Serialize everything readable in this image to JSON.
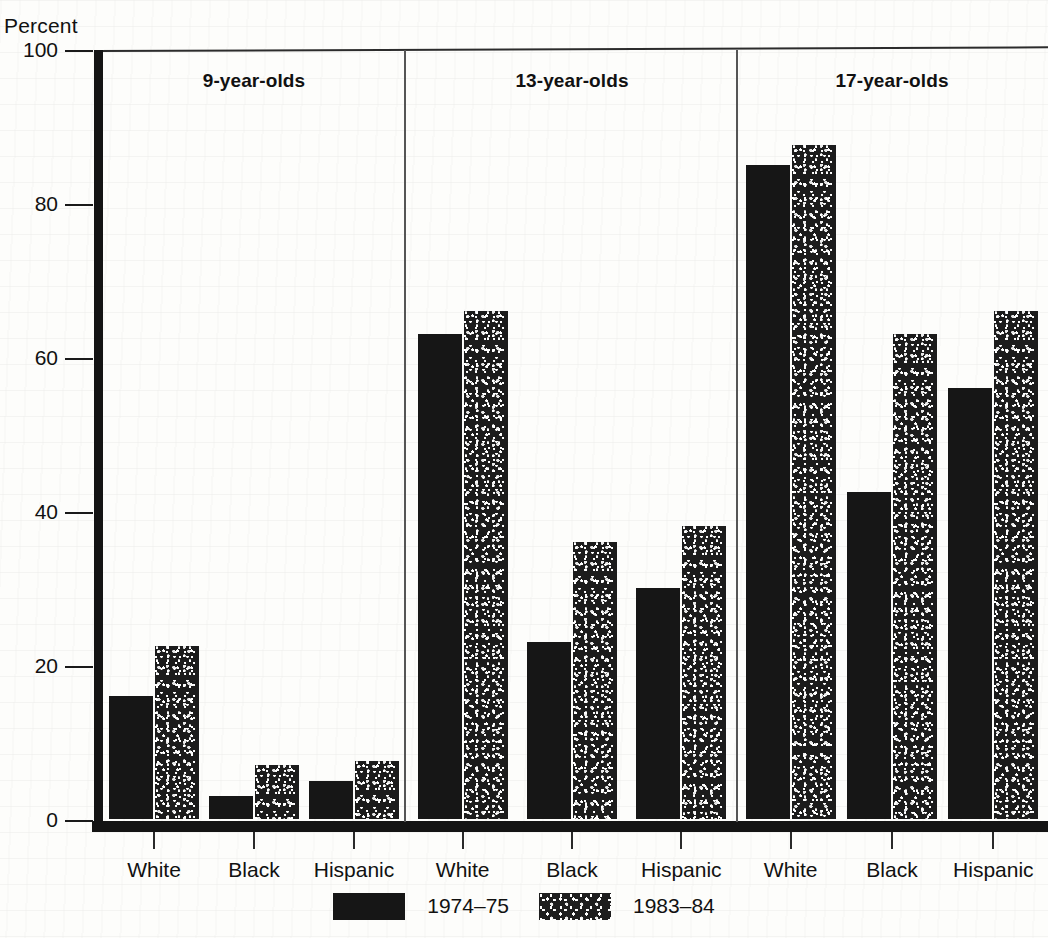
{
  "axis": {
    "y_title": "Percent",
    "y_ticks": [
      "100",
      "80",
      "60",
      "40",
      "20",
      "0"
    ]
  },
  "groups": [
    {
      "heading": "9-year-olds",
      "categories": [
        "White",
        "Black",
        "Hispanic"
      ]
    },
    {
      "heading": "13-year-olds",
      "categories": [
        "White",
        "Black",
        "Hispanic"
      ]
    },
    {
      "heading": "17-year-olds",
      "categories": [
        "White",
        "Black",
        "Hispanic"
      ]
    }
  ],
  "legend": {
    "items": [
      {
        "label": "1974–75",
        "swatch": "solid-black-swatch"
      },
      {
        "label": "1983–84",
        "swatch": "speckled-swatch"
      }
    ]
  },
  "colors": {
    "series_1974_75": "#161616",
    "series_1983_84": "#1e1e1e",
    "axis": "#141414",
    "background": "#fdfdfb"
  },
  "chart_data": {
    "type": "bar",
    "title": "",
    "subtitle": "",
    "xlabel": "",
    "ylabel": "Percent",
    "ylim": [
      0,
      100
    ],
    "yticks": [
      0,
      20,
      40,
      60,
      80,
      100
    ],
    "grid": false,
    "legend_position": "bottom-center",
    "group_labels": [
      "9-year-olds",
      "13-year-olds",
      "17-year-olds"
    ],
    "categories": [
      "9-year-olds / White",
      "9-year-olds / Black",
      "9-year-olds / Hispanic",
      "13-year-olds / White",
      "13-year-olds / Black",
      "13-year-olds / Hispanic",
      "17-year-olds / White",
      "17-year-olds / Black",
      "17-year-olds / Hispanic"
    ],
    "series": [
      {
        "name": "1974–75",
        "values": [
          16,
          3,
          5,
          63,
          23,
          30,
          85,
          42.5,
          56
        ]
      },
      {
        "name": "1983–84",
        "values": [
          22.5,
          7,
          7.5,
          66,
          36,
          38,
          87.5,
          63,
          66
        ]
      }
    ]
  }
}
